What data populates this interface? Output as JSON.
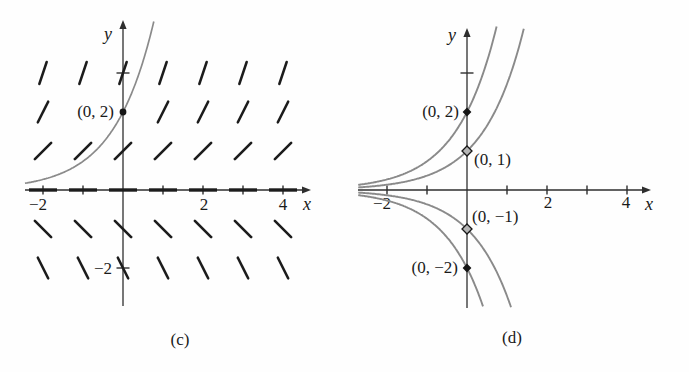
{
  "colors": {
    "background": "#fefefe",
    "axis": "#2e2e2e",
    "slope_mark": "#1c1c1c",
    "curve": "#8a8a8a",
    "text": "#1a1a1a",
    "marker_filled": "#161616",
    "marker_open_fill": "#b5b5b5"
  },
  "chart_data": [
    {
      "type": "line",
      "variant": "slope-field-with-solution-curve",
      "caption": "(c)",
      "xlabel": "x",
      "ylabel": "y",
      "xlim": [
        -2.45,
        4.7
      ],
      "ylim": [
        -3.0,
        4.4
      ],
      "grid": false,
      "legend": "none",
      "x_ticks": [
        -2,
        -1,
        1,
        2,
        3,
        4
      ],
      "x_tick_labels": [
        {
          "value": -2,
          "text": "−2",
          "px": 38,
          "py": 210
        },
        {
          "value": 2,
          "text": "2",
          "px": 204,
          "py": 210
        },
        {
          "value": 4,
          "text": "4",
          "px": 283,
          "py": 210
        }
      ],
      "y_ticks": [
        3,
        -2
      ],
      "y_tick_labels": [
        {
          "value": -2,
          "text": "−2",
          "px": 112,
          "py": 274,
          "anchor": "end"
        }
      ],
      "slope_field": {
        "ode": "dy/dx = y",
        "slope_rule": "m = y",
        "grid_x": [
          -2,
          -1,
          0,
          1,
          2,
          3,
          4
        ],
        "grid_y": [
          3,
          2,
          1,
          0,
          -1,
          -2
        ],
        "omitted_cells": [
          [
            -1,
            2
          ],
          [
            0,
            2
          ]
        ]
      },
      "series": [
        {
          "name": "y = 2e^x",
          "kind": "exponential",
          "coefficient": 2,
          "x_start": -2.45,
          "sample_points": [
            [
              -2,
              0.27
            ],
            [
              -1,
              0.74
            ],
            [
              0,
              2
            ],
            [
              0.41,
              3
            ],
            [
              0.75,
              4.2
            ]
          ]
        }
      ],
      "point_labels": [
        {
          "x": 0,
          "y": 2,
          "text": "(0, 2)",
          "marker": "filled-dot",
          "anchor": "end",
          "px": 114,
          "py": 117
        }
      ],
      "render": {
        "origin": [
          123,
          190
        ],
        "scale": [
          40,
          39
        ],
        "x_axis": {
          "line": [
            25,
            303
          ],
          "tip": 311
        },
        "y_axis": {
          "line": [
            28,
            306
          ],
          "tip": 20
        },
        "clip": {
          "top": 20,
          "bottom": 306,
          "right": 304
        },
        "x_letter": [
          307,
          210
        ],
        "y_letter": [
          108,
          40
        ],
        "curve_width": 1.7
      }
    },
    {
      "type": "line",
      "variant": "solution-curve-family",
      "caption": "(d)",
      "xlabel": "x",
      "ylabel": "y",
      "xlim": [
        -2.72,
        4.7
      ],
      "ylim": [
        -3.05,
        4.15
      ],
      "grid": false,
      "legend": "none",
      "x_ticks": [
        -2,
        -1,
        1,
        2,
        3,
        4
      ],
      "x_tick_labels": [
        {
          "value": -2,
          "text": "−2",
          "px": 382,
          "py": 209
        },
        {
          "value": 2,
          "text": "2",
          "px": 548,
          "py": 208
        },
        {
          "value": 4,
          "text": "4",
          "px": 626,
          "py": 208
        }
      ],
      "y_ticks": [
        3
      ],
      "y_tick_labels": [],
      "series": [
        {
          "name": "y = 2e^x",
          "kind": "exponential",
          "coefficient": 2,
          "x_start": -2.72,
          "sample_points": [
            [
              -2,
              0.27
            ],
            [
              0,
              2
            ],
            [
              0.69,
              4
            ]
          ]
        },
        {
          "name": "y = e^x",
          "kind": "exponential",
          "coefficient": 1,
          "x_start": -2.72,
          "sample_points": [
            [
              -2,
              0.14
            ],
            [
              0,
              1
            ],
            [
              1.39,
              4
            ]
          ]
        },
        {
          "name": "y = −e^x",
          "kind": "exponential",
          "coefficient": -1,
          "x_start": -2.72,
          "sample_points": [
            [
              -2,
              -0.14
            ],
            [
              0,
              -1
            ],
            [
              1.11,
              -3
            ]
          ]
        },
        {
          "name": "y = −2e^x",
          "kind": "exponential",
          "coefficient": -2,
          "x_start": -2.72,
          "sample_points": [
            [
              -2,
              -0.27
            ],
            [
              0,
              -2
            ],
            [
              0.41,
              -3
            ]
          ]
        }
      ],
      "point_labels": [
        {
          "x": 0,
          "y": 2,
          "text": "(0, 2)",
          "marker": "filled-diamond",
          "anchor": "end",
          "px": 459,
          "py": 117
        },
        {
          "x": 0,
          "y": 1,
          "text": "(0, 1)",
          "marker": "open-diamond",
          "anchor": "start",
          "px": 474,
          "py": 165
        },
        {
          "x": 0,
          "y": -1,
          "text": "(0, −1)",
          "marker": "open-diamond",
          "anchor": "start",
          "px": 472,
          "py": 222
        },
        {
          "x": 0,
          "y": -2,
          "text": "(0, −2)",
          "marker": "filled-diamond",
          "anchor": "end",
          "px": 458,
          "py": 273
        }
      ],
      "render": {
        "origin": [
          467,
          190
        ],
        "scale": [
          40,
          39
        ],
        "x_axis": {
          "line": [
            358,
            643
          ],
          "tip": 651
        },
        "y_axis": {
          "line": [
            36,
            308
          ],
          "tip": 28
        },
        "clip": {
          "top": 26,
          "bottom": 308,
          "right": 644
        },
        "x_letter": [
          649,
          210
        ],
        "y_letter": [
          452,
          41
        ],
        "curve_width": 1.9
      }
    }
  ]
}
